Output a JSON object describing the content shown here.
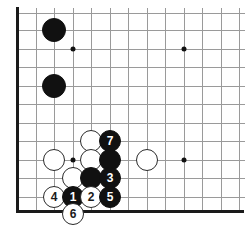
{
  "diagram": {
    "kind": "go-board-diagram",
    "board": {
      "line_color": "#9a9a9a",
      "edge_color": "#1a1a1a",
      "background": "#ffffff",
      "spacing": 18.5,
      "x_lines": [
        17,
        36,
        54,
        73,
        91,
        110,
        128,
        147,
        165,
        184,
        202,
        221,
        239
      ],
      "y_lines": [
        13,
        30,
        49,
        67,
        86,
        104,
        123,
        141,
        160,
        178,
        197,
        210
      ],
      "left_edge_x": 17,
      "bottom_edge_y": 210,
      "radius": 11
    },
    "star_points": [
      {
        "name": "star-point-upper-left",
        "x": 73,
        "y": 49
      },
      {
        "name": "star-point-upper-right",
        "x": 184,
        "y": 49
      },
      {
        "name": "star-point-lower-left",
        "x": 73,
        "y": 160
      },
      {
        "name": "star-point-lower-right",
        "x": 184,
        "y": 160
      }
    ],
    "stones": [
      {
        "id": "black-stone-upper-a",
        "color": "black",
        "label": "",
        "x": 54,
        "y": 30,
        "r": 12
      },
      {
        "id": "black-stone-upper-b",
        "color": "black",
        "label": "",
        "x": 54,
        "y": 86,
        "r": 12
      },
      {
        "id": "white-stone-left",
        "color": "white",
        "label": "",
        "x": 54,
        "y": 160,
        "r": 11
      },
      {
        "id": "white-stone-upper-c",
        "color": "white",
        "label": "",
        "x": 91,
        "y": 141,
        "r": 11
      },
      {
        "id": "white-stone-mid",
        "color": "white",
        "label": "",
        "x": 91,
        "y": 160,
        "r": 11
      },
      {
        "id": "white-stone-right",
        "color": "white",
        "label": "",
        "x": 147,
        "y": 160,
        "r": 11
      },
      {
        "id": "white-stone-lower",
        "color": "white",
        "label": "",
        "x": 73,
        "y": 178,
        "r": 11
      },
      {
        "id": "black-move-7",
        "color": "black",
        "label": "7",
        "x": 110,
        "y": 141,
        "r": 11
      },
      {
        "id": "black-stone-col-a",
        "color": "black",
        "label": "",
        "x": 110,
        "y": 160,
        "r": 11
      },
      {
        "id": "black-stone-col-b",
        "color": "black",
        "label": "",
        "x": 91,
        "y": 178,
        "r": 11
      },
      {
        "id": "black-move-3",
        "color": "black",
        "label": "3",
        "x": 110,
        "y": 178,
        "r": 11
      },
      {
        "id": "white-move-4",
        "color": "white",
        "label": "4",
        "x": 54,
        "y": 197,
        "r": 11
      },
      {
        "id": "black-move-1",
        "color": "black",
        "label": "1",
        "x": 73,
        "y": 197,
        "r": 11
      },
      {
        "id": "white-move-2",
        "color": "white",
        "label": "2",
        "x": 91,
        "y": 197,
        "r": 11
      },
      {
        "id": "black-move-5",
        "color": "black",
        "label": "5",
        "x": 110,
        "y": 197,
        "r": 11
      },
      {
        "id": "white-move-6",
        "color": "white",
        "label": "6",
        "x": 73,
        "y": 214,
        "r": 11
      }
    ],
    "move_sequence": [
      "1",
      "2",
      "3",
      "4",
      "5",
      "6",
      "7"
    ]
  }
}
